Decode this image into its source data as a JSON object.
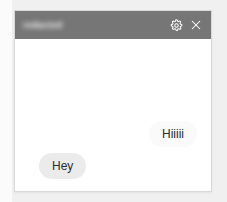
{
  "window": {
    "title": "redacted",
    "title_redacted": true,
    "header_color": "#767676",
    "body_color": "#ffffff",
    "border_color": "#d8d8d8"
  },
  "titlebar": {
    "settings_icon": "gear-icon",
    "close_icon": "close-icon"
  },
  "conversation": {
    "messages": [
      {
        "text": "Hiiiii",
        "side": "right",
        "direction": "outgoing",
        "bubble_color": "#fafafa",
        "text_color": "#2b2b2b"
      },
      {
        "text": "Hey",
        "side": "left",
        "direction": "incoming",
        "bubble_color": "#ebebeb",
        "text_color": "#2b2b2b"
      }
    ]
  },
  "page": {
    "background_color": "#f0f0f0"
  }
}
